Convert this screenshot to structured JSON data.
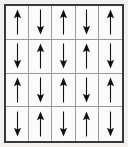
{
  "figure": {
    "name": "spin-lattice-grid",
    "rows": 4,
    "columns": 5,
    "total_cells": 20,
    "up_count": 10,
    "down_count": 10,
    "pattern": "alternating-antiferromagnetic-checkerboard"
  },
  "colors": {
    "page_background": "#f2f1ef",
    "cell_background": "#fbfbfb",
    "outer_border": "#3a3a3a",
    "inner_gridline": "#9a9a9a",
    "arrow": "#111111"
  },
  "icons": {
    "up": "arrow-up-icon",
    "down": "arrow-down-icon"
  },
  "labels": {
    "up": "up",
    "down": "down"
  },
  "chart_data": {
    "type": "heatmap",
    "title": "",
    "xlabel": "",
    "ylabel": "",
    "grid": true,
    "legend": "none",
    "categories": [
      "col-1",
      "col-2",
      "col-3",
      "col-4",
      "col-5"
    ],
    "row_labels": [
      "row-1",
      "row-2",
      "row-3",
      "row-4"
    ],
    "value_encoding": {
      "up": 1,
      "down": -1
    },
    "rows": [
      {
        "row": 1,
        "values": [
          1,
          -1,
          1,
          -1,
          1
        ],
        "directions": [
          "up",
          "down",
          "up",
          "down",
          "up"
        ]
      },
      {
        "row": 2,
        "values": [
          -1,
          1,
          -1,
          1,
          -1
        ],
        "directions": [
          "down",
          "up",
          "down",
          "up",
          "down"
        ]
      },
      {
        "row": 3,
        "values": [
          1,
          -1,
          1,
          -1,
          1
        ],
        "directions": [
          "up",
          "down",
          "up",
          "down",
          "up"
        ]
      },
      {
        "row": 4,
        "values": [
          -1,
          1,
          -1,
          1,
          -1
        ],
        "directions": [
          "down",
          "up",
          "down",
          "up",
          "down"
        ]
      }
    ],
    "net_magnetization": 0
  }
}
